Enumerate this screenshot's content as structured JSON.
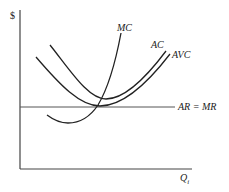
{
  "diagram": {
    "y_axis_label": "$",
    "x_axis_label": "Q",
    "x_axis_subscript": "i",
    "curves": {
      "mc": {
        "label": "MC"
      },
      "ac": {
        "label": "AC"
      },
      "avc": {
        "label": "AVC"
      },
      "ar_mr": {
        "label": "AR = MR"
      }
    },
    "colors": {
      "line": "#222222",
      "axis": "#444444",
      "ar_line": "#555555"
    }
  }
}
